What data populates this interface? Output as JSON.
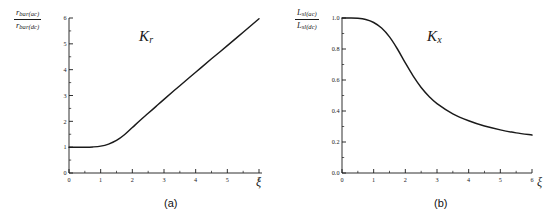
{
  "figure": {
    "background_color": "#ffffff",
    "line_color": "#1a1a1a",
    "panels": [
      {
        "caption": "(a)",
        "curve_label": "K",
        "curve_label_sub": "r",
        "xi_label": "ξ",
        "ylabel_num_main": "r",
        "ylabel_num_sub": "bar(ac)",
        "ylabel_den_main": "r",
        "ylabel_den_sub": "bar(dc)"
      },
      {
        "caption": "(b)",
        "curve_label": "K",
        "curve_label_sub": "x",
        "xi_label": "ξ",
        "ylabel_num_main": "L",
        "ylabel_num_sub": "sl(ac)",
        "ylabel_den_main": "L",
        "ylabel_den_sub": "sl(dc)"
      }
    ]
  },
  "chart_data": [
    {
      "type": "line",
      "title": "",
      "panel": "(a)",
      "series_name": "K_r",
      "xlabel": "ξ",
      "ylabel": "r_bar(ac) / r_bar(dc)",
      "xlim": [
        0,
        6
      ],
      "ylim": [
        0,
        6
      ],
      "grid": false,
      "legend": "none",
      "xticks": [
        0,
        1,
        2,
        3,
        4,
        5,
        6
      ],
      "xticklabels": [
        "0",
        "1",
        "2",
        "3",
        "4",
        "5",
        "6"
      ],
      "yticks": [
        0,
        1,
        2,
        3,
        4,
        5,
        6
      ],
      "yticklabels": [
        "0",
        "1",
        "2",
        "3",
        "4",
        "5",
        "6"
      ],
      "x": [
        0,
        0.25,
        0.5,
        0.75,
        1.0,
        1.25,
        1.5,
        1.75,
        2.0,
        2.25,
        2.5,
        2.75,
        3.0,
        3.5,
        4.0,
        4.5,
        5.0,
        5.5,
        6.0
      ],
      "values": [
        1.0,
        1.0,
        1.0,
        1.01,
        1.04,
        1.12,
        1.26,
        1.48,
        1.76,
        2.04,
        2.31,
        2.58,
        2.85,
        3.38,
        3.9,
        4.42,
        4.93,
        5.45,
        5.97
      ]
    },
    {
      "type": "line",
      "title": "",
      "panel": "(b)",
      "series_name": "K_x",
      "xlabel": "ξ",
      "ylabel": "L_sl(ac) / L_sl(dc)",
      "xlim": [
        0,
        6
      ],
      "ylim": [
        0.0,
        1.0
      ],
      "grid": false,
      "legend": "none",
      "xticks": [
        0,
        1,
        2,
        3,
        4,
        5,
        6
      ],
      "xticklabels": [
        "0",
        "1",
        "2",
        "3",
        "4",
        "5",
        "6"
      ],
      "yticks": [
        0.0,
        0.2,
        0.4,
        0.6,
        0.8,
        1.0
      ],
      "yticklabels": [
        "0.0",
        "0.2",
        "0.4",
        "0.6",
        "0.8",
        "1.0"
      ],
      "x": [
        0,
        0.25,
        0.5,
        0.75,
        1.0,
        1.25,
        1.5,
        1.75,
        2.0,
        2.25,
        2.5,
        2.75,
        3.0,
        3.5,
        4.0,
        4.5,
        5.0,
        5.5,
        6.0
      ],
      "values": [
        1.0,
        1.0,
        0.998,
        0.99,
        0.971,
        0.935,
        0.878,
        0.8,
        0.71,
        0.625,
        0.552,
        0.494,
        0.448,
        0.382,
        0.337,
        0.303,
        0.278,
        0.259,
        0.245
      ]
    }
  ]
}
